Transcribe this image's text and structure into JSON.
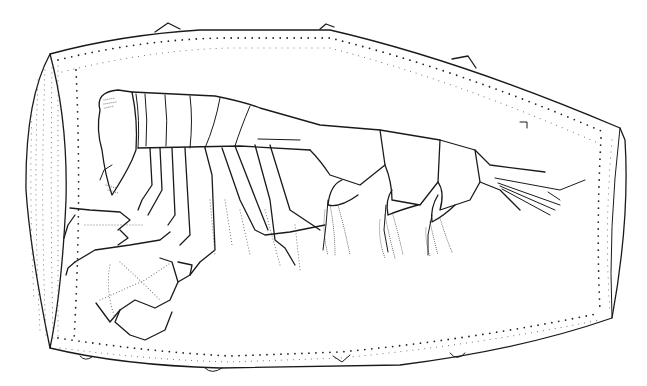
{
  "figure": {
    "subject": "Amphipod crustacean inside barrel-shaped case, lateral view",
    "style": "black ink line drawing with stippling",
    "colors": {
      "ink": "#1a1a1a",
      "background": "#ffffff"
    }
  }
}
